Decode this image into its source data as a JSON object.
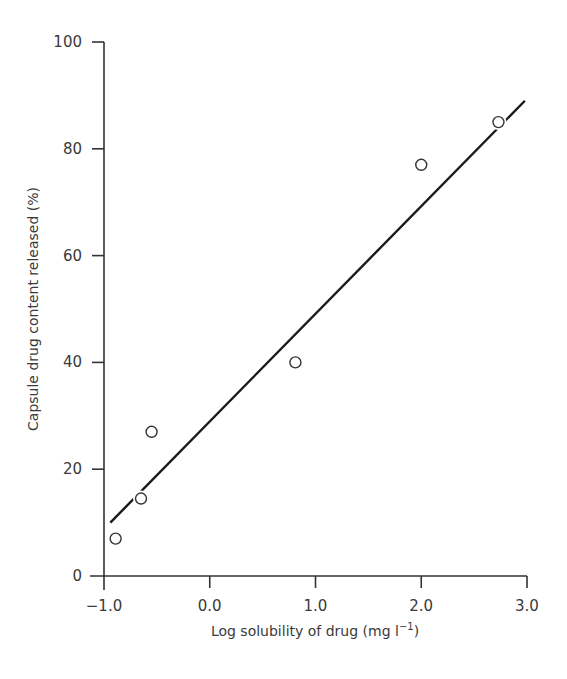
{
  "chart_data": {
    "type": "scatter",
    "title": "",
    "xlabel": "Log solubility of drug (mg l⁻¹)",
    "xlabel_main": "Log solubility of drug (mg l",
    "xlabel_sup": "−1",
    "xlabel_close": ")",
    "ylabel": "Capsule drug content released (%)",
    "xlim": [
      -1.0,
      3.0
    ],
    "ylim": [
      0,
      100
    ],
    "x_ticks": [
      -1.0,
      0.0,
      1.0,
      2.0,
      3.0
    ],
    "x_tick_labels": [
      "−1.0",
      "0.0",
      "1.0",
      "2.0",
      "3.0"
    ],
    "y_ticks": [
      0,
      20,
      40,
      60,
      80,
      100
    ],
    "y_tick_labels": [
      "0",
      "20",
      "40",
      "60",
      "80",
      "100"
    ],
    "grid": false,
    "legend": null,
    "series": [
      {
        "name": "Observed",
        "marker": "open-circle",
        "x": [
          -0.89,
          -0.65,
          -0.55,
          0.81,
          2.0,
          2.73
        ],
        "y": [
          7,
          14.5,
          27,
          40,
          77,
          85
        ]
      },
      {
        "name": "Linear fit",
        "marker": "line",
        "x": [
          -0.94,
          2.98
        ],
        "y": [
          10,
          89
        ]
      }
    ]
  },
  "colors": {
    "ink": "#333333",
    "background": "#ffffff"
  }
}
